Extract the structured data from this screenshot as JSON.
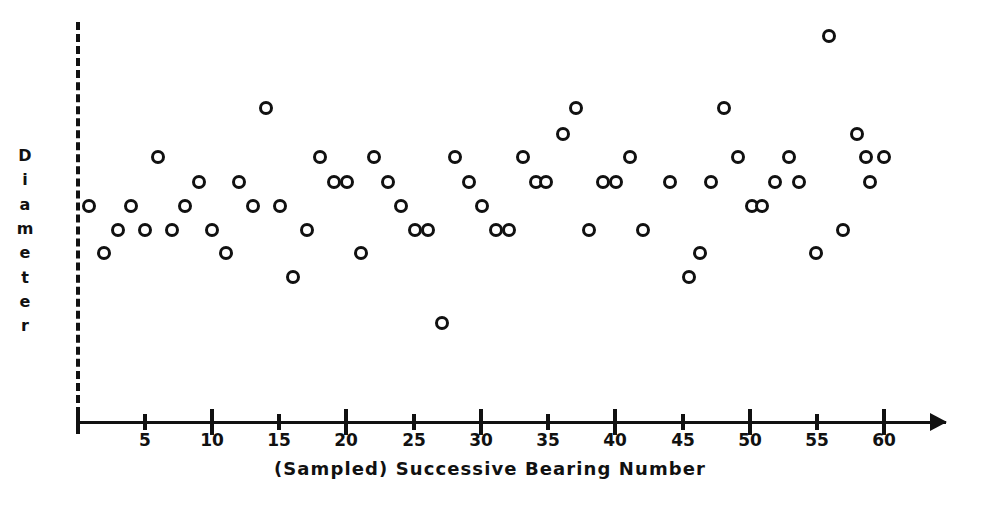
{
  "figure": {
    "background_color": "#ffffff",
    "ink_color": "#111111",
    "marker_style": "open-circle",
    "marker_label": "data-point-circle"
  },
  "y_axis": {
    "title": "Diameter",
    "title_letters": [
      "D",
      "i",
      "a",
      "m",
      "e",
      "t",
      "e",
      "r"
    ],
    "style": "dashed",
    "tick_labels": [],
    "note": "no numeric scale shown"
  },
  "x_axis": {
    "label": "(Sampled) Successive Bearing Number",
    "tick_labels": [
      "5",
      "10",
      "15",
      "20",
      "25",
      "30",
      "35",
      "40",
      "45",
      "50",
      "55",
      "60"
    ],
    "major_ticks": [
      10,
      20,
      30,
      40,
      50,
      60
    ],
    "minor_ticks": [
      5,
      15,
      25,
      35,
      45,
      55
    ],
    "min": 0,
    "max": 60,
    "arrowhead": "right-arrow-icon"
  },
  "chart_data": {
    "type": "scatter",
    "title": "",
    "subtitle": "",
    "xlabel": "(Sampled) Successive Bearing Number",
    "ylabel": "Diameter",
    "xlim": [
      0,
      63
    ],
    "ylim": [
      0,
      9
    ],
    "grid": false,
    "legend": null,
    "series": [
      {
        "name": "Diameter measurement",
        "marker": "open-circle",
        "x": [
          1,
          2,
          3,
          4,
          5,
          6,
          7,
          8,
          9,
          10,
          11,
          12,
          13,
          14,
          15,
          16,
          17,
          18,
          19,
          20,
          21,
          22,
          23,
          24,
          25,
          26,
          27,
          28,
          29,
          30,
          31,
          32,
          33,
          34,
          35,
          36,
          37,
          38,
          39,
          40,
          41,
          42,
          43,
          44,
          45,
          46,
          47,
          48,
          49,
          50,
          51,
          52,
          53,
          54,
          55,
          56,
          57,
          58,
          59,
          60
        ],
        "y": [
          4,
          3,
          3,
          3,
          4,
          5,
          3,
          4,
          3,
          4,
          4,
          3,
          7,
          4,
          2,
          4,
          5,
          5,
          4,
          4,
          5,
          4,
          3,
          3,
          4,
          3,
          1,
          4,
          3,
          5,
          4,
          3,
          4,
          4,
          5,
          6,
          7,
          4,
          4,
          4,
          3,
          4,
          3,
          2.5,
          2,
          4,
          7,
          5,
          4,
          4,
          4,
          5,
          4,
          4,
          9,
          3,
          5,
          6,
          4,
          5
        ],
        "y_units": "arbitrary (unlabeled)"
      }
    ],
    "n_points": 60
  },
  "points_px": [
    {
      "n": 1,
      "x": 89,
      "y": 206
    },
    {
      "n": 2,
      "x": 104,
      "y": 253
    },
    {
      "n": 3,
      "x": 118,
      "y": 230
    },
    {
      "n": 4,
      "x": 131,
      "y": 206
    },
    {
      "n": 5,
      "x": 145,
      "y": 230
    },
    {
      "n": 6,
      "x": 158,
      "y": 157
    },
    {
      "n": 7,
      "x": 172,
      "y": 230
    },
    {
      "n": 8,
      "x": 185,
      "y": 206
    },
    {
      "n": 9,
      "x": 199,
      "y": 182
    },
    {
      "n": 10,
      "x": 212,
      "y": 230
    },
    {
      "n": 11,
      "x": 226,
      "y": 253
    },
    {
      "n": 12,
      "x": 239,
      "y": 182
    },
    {
      "n": 13,
      "x": 253,
      "y": 206
    },
    {
      "n": 14,
      "x": 266,
      "y": 108
    },
    {
      "n": 15,
      "x": 280,
      "y": 206
    },
    {
      "n": 16,
      "x": 293,
      "y": 277
    },
    {
      "n": 17,
      "x": 307,
      "y": 230
    },
    {
      "n": 18,
      "x": 320,
      "y": 157
    },
    {
      "n": 19,
      "x": 334,
      "y": 182
    },
    {
      "n": 20,
      "x": 347,
      "y": 182
    },
    {
      "n": 21,
      "x": 361,
      "y": 253
    },
    {
      "n": 22,
      "x": 374,
      "y": 157
    },
    {
      "n": 23,
      "x": 388,
      "y": 182
    },
    {
      "n": 24,
      "x": 401,
      "y": 206
    },
    {
      "n": 25,
      "x": 415,
      "y": 230
    },
    {
      "n": 26,
      "x": 428,
      "y": 230
    },
    {
      "n": 27,
      "x": 442,
      "y": 323
    },
    {
      "n": 28,
      "x": 455,
      "y": 157
    },
    {
      "n": 29,
      "x": 469,
      "y": 182
    },
    {
      "n": 30,
      "x": 482,
      "y": 206
    },
    {
      "n": 31,
      "x": 496,
      "y": 230
    },
    {
      "n": 32,
      "x": 509,
      "y": 230
    },
    {
      "n": 33,
      "x": 523,
      "y": 157
    },
    {
      "n": 34,
      "x": 536,
      "y": 182
    },
    {
      "n": 35,
      "x": 546,
      "y": 182
    },
    {
      "n": 36,
      "x": 563,
      "y": 134
    },
    {
      "n": 37,
      "x": 576,
      "y": 108
    },
    {
      "n": 38,
      "x": 589,
      "y": 230
    },
    {
      "n": 39,
      "x": 603,
      "y": 182
    },
    {
      "n": 40,
      "x": 616,
      "y": 182
    },
    {
      "n": 41,
      "x": 630,
      "y": 157
    },
    {
      "n": 42,
      "x": 643,
      "y": 230
    },
    {
      "n": 43,
      "x": 670,
      "y": 182
    },
    {
      "n": 44,
      "x": 700,
      "y": 253
    },
    {
      "n": 45,
      "x": 689,
      "y": 277
    },
    {
      "n": 46,
      "x": 711,
      "y": 182
    },
    {
      "n": 47,
      "x": 724,
      "y": 108
    },
    {
      "n": 48,
      "x": 738,
      "y": 157
    },
    {
      "n": 49,
      "x": 752,
      "y": 206
    },
    {
      "n": 50,
      "x": 762,
      "y": 206
    },
    {
      "n": 51,
      "x": 775,
      "y": 182
    },
    {
      "n": 52,
      "x": 789,
      "y": 157
    },
    {
      "n": 53,
      "x": 799,
      "y": 182
    },
    {
      "n": 54,
      "x": 816,
      "y": 253
    },
    {
      "n": 55,
      "x": 829,
      "y": 36
    },
    {
      "n": 56,
      "x": 843,
      "y": 230
    },
    {
      "n": 57,
      "x": 857,
      "y": 134
    },
    {
      "n": 58,
      "x": 866,
      "y": 157
    },
    {
      "n": 59,
      "x": 870,
      "y": 182
    },
    {
      "n": 60,
      "x": 884,
      "y": 157
    }
  ],
  "geometry": {
    "y_axis_x": 78,
    "y_axis_top": 22,
    "y_axis_bottom": 427,
    "x_axis_y": 422,
    "x_origin_px": 78,
    "px_per_unit": 13.43,
    "arrow_end_x": 946,
    "tick_label_y": 430,
    "axis_label_y": 458,
    "y_title_x": 22,
    "y_title_top": 145
  }
}
